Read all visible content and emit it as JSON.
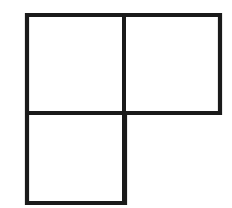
{
  "figure": {
    "name": "L-tromino",
    "background_color": "#ffffff",
    "stroke_color": "#1a1a1a",
    "stroke_width": 4,
    "canvas": {
      "width": 232,
      "height": 208
    },
    "grid": {
      "columns": 2,
      "rows": 2,
      "cell_width": 97,
      "cell_height": 98,
      "origin_x": 27,
      "origin_y": 15
    },
    "cells": [
      {
        "id": "cell-top-left",
        "row": 0,
        "column": 0,
        "filled": true,
        "x": 27,
        "y": 15,
        "width": 97,
        "height": 98
      },
      {
        "id": "cell-top-right",
        "row": 0,
        "column": 1,
        "filled": true,
        "x": 124,
        "y": 15,
        "width": 96,
        "height": 98
      },
      {
        "id": "cell-bottom-left",
        "row": 1,
        "column": 0,
        "filled": true,
        "x": 27,
        "y": 113,
        "width": 98,
        "height": 90
      },
      {
        "id": "cell-bottom-right",
        "row": 1,
        "column": 1,
        "filled": false,
        "x": 125,
        "y": 113,
        "width": 95,
        "height": 90
      }
    ],
    "outline_path": "M 27 15 L 220 15 L 220 113 L 125 113 L 125 203 L 27 203 Z",
    "divider_lines": [
      {
        "id": "vertical-divider",
        "x1": 124,
        "y1": 15,
        "x2": 124,
        "y2": 203
      },
      {
        "id": "horizontal-divider",
        "x1": 27,
        "y1": 113,
        "x2": 220,
        "y2": 113
      }
    ]
  }
}
